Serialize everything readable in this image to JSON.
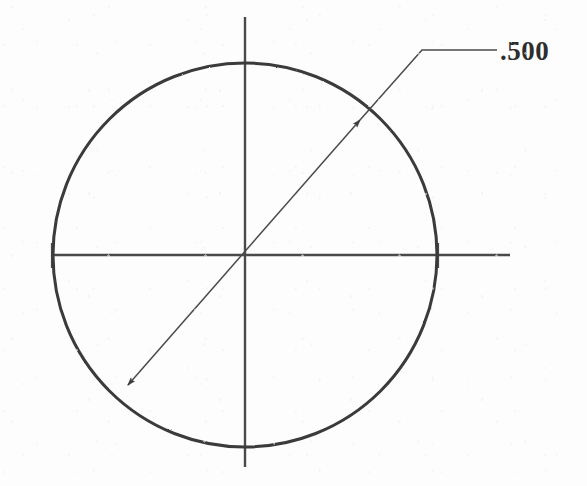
{
  "drawing": {
    "title": "Circle with diameter dimension",
    "background_color": "#fdfdfd",
    "line_color": "#3a3a3a",
    "thin_line_color": "#4a4a4a",
    "text_color": "#2e2e2e"
  },
  "dimension": {
    "value_label": ".500",
    "kind": "diameter"
  },
  "chart_data": {
    "type": "diagram",
    "shapes": [
      {
        "name": "circle",
        "kind": "circle",
        "center_x": 245,
        "center_y": 255,
        "radius": 192,
        "stroke_width": 3,
        "color": "#3a3a3a"
      },
      {
        "name": "horizontal-centerline",
        "kind": "line",
        "x1": 52,
        "y1": 255,
        "x2": 510,
        "y2": 255,
        "stroke_width": 2.4,
        "color": "#4a4a4a"
      },
      {
        "name": "vertical-centerline",
        "kind": "line",
        "x1": 245,
        "y1": 17,
        "x2": 245,
        "y2": 467,
        "stroke_width": 2.4,
        "color": "#4a4a4a"
      },
      {
        "name": "diameter-dimension-line",
        "kind": "line",
        "x1": 128,
        "y1": 385,
        "x2": 360,
        "y2": 120,
        "stroke_width": 1.5,
        "color": "#4a4a4a"
      },
      {
        "name": "leader-diagonal",
        "kind": "line",
        "x1": 360,
        "y1": 120,
        "x2": 422,
        "y2": 50,
        "stroke_width": 1.5,
        "color": "#4a4a4a"
      },
      {
        "name": "leader-shelf",
        "kind": "line",
        "x1": 422,
        "y1": 50,
        "x2": 497,
        "y2": 50,
        "stroke_width": 1.5,
        "color": "#4a4a4a"
      }
    ],
    "arrowheads": [
      {
        "name": "arrowhead-upper-right",
        "x": 360,
        "y": 120,
        "angle_deg": -48.8
      },
      {
        "name": "arrowhead-lower-left",
        "x": 128,
        "y": 385,
        "angle_deg": 131.2
      }
    ],
    "labels": [
      {
        "name": "diameter-value-label",
        "text": ".500",
        "x": 500,
        "y": 60,
        "font_size": 27,
        "color": "#2e2e2e"
      }
    ]
  }
}
